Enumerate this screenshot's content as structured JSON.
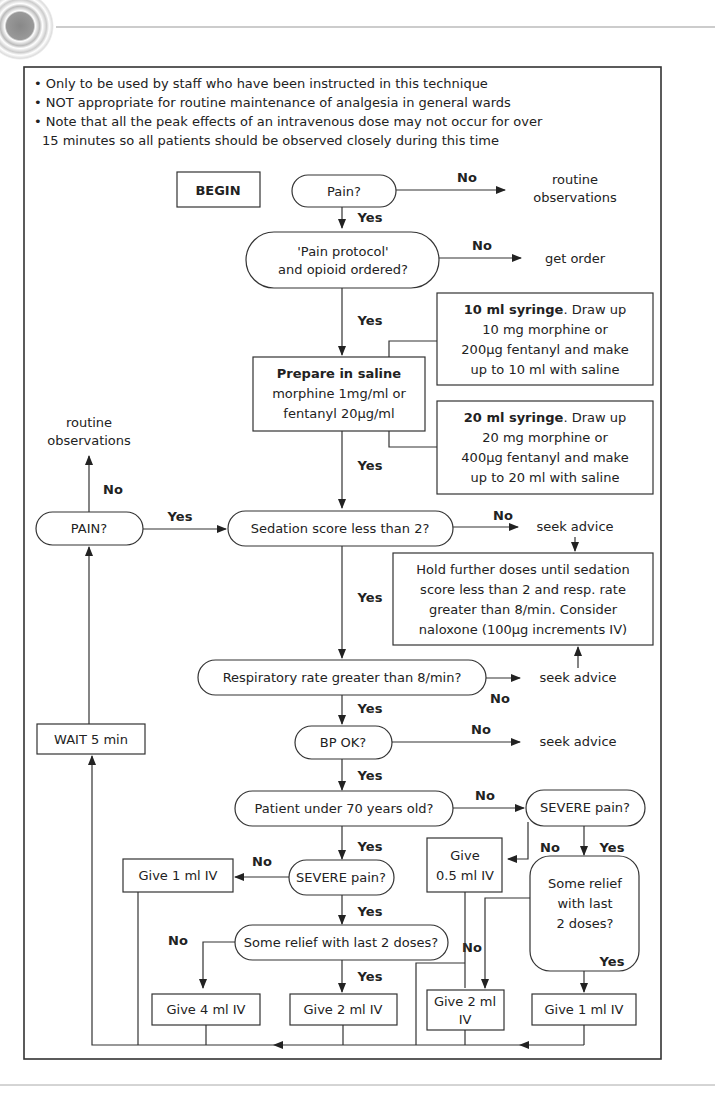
{
  "notes": [
    "• Only to be used by staff who have been instructed in this technique",
    "• NOT appropriate for routine maintenance of analgesia in general wards",
    "• Note that all the peak effects of an intravenous dose may not occur for over",
    "15 minutes so all patients should be observed closely during this time"
  ],
  "nodes": {
    "begin": "BEGIN",
    "pain": "Pain?",
    "routine_obs_top_1": "routine",
    "routine_obs_top_2": "observations",
    "protocol_1": "'Pain protocol'",
    "protocol_2": "and opioid ordered?",
    "get_order": "get order",
    "syringe10_bold": "10 ml syringe",
    "syringe10_1": ". Draw up",
    "syringe10_2": "10 mg morphine or",
    "syringe10_3": "200μg fentanyl and make",
    "syringe10_4": "up to 10 ml with saline",
    "prepare_bold": "Prepare in saline",
    "prepare_1": "morphine 1mg/ml or",
    "prepare_2": "fentanyl 20μg/ml",
    "syringe20_bold": "20 ml syringe",
    "syringe20_1": ". Draw up",
    "syringe20_2": "20 mg morphine or",
    "syringe20_3": "400μg fentanyl and make",
    "syringe20_4": "up to 20 ml with saline",
    "routine_obs_left_1": "routine",
    "routine_obs_left_2": "observations",
    "pain_caps": "PAIN?",
    "sedation": "Sedation score less than 2?",
    "seek_advice_1": "seek advice",
    "hold_1": "Hold further doses until sedation",
    "hold_2": "score less than 2 and resp. rate",
    "hold_3": "greater than 8/min. Consider",
    "hold_4": "naloxone (100μg increments IV)",
    "resp": "Respiratory rate greater than 8/min?",
    "seek_advice_2": "seek advice",
    "wait": "WAIT 5 min",
    "bp": "BP OK?",
    "seek_advice_3": "seek advice",
    "under70": "Patient under 70 years old?",
    "severe_right": "SEVERE pain?",
    "give_05_1": "Give",
    "give_05_2": "0.5 ml IV",
    "relief_right_1": "Some relief",
    "relief_right_2": "with last",
    "relief_right_3": "2 doses?",
    "give_1_left": "Give 1 ml IV",
    "severe_mid": "SEVERE pain?",
    "relief_mid": "Some relief with last 2 doses?",
    "give_4": "Give 4 ml IV",
    "give_2_mid": "Give 2 ml IV",
    "give_2_right_1": "Give 2 ml",
    "give_2_right_2": "IV",
    "give_1_right": "Give 1 ml IV"
  },
  "labels": {
    "yes": "Yes",
    "no": "No"
  },
  "footer": {
    "page_number": "42"
  }
}
